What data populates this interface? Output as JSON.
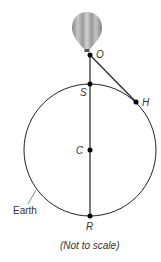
{
  "diagram": {
    "points": {
      "O": {
        "label": "O",
        "x": 90,
        "y": 55
      },
      "S": {
        "label": "S",
        "x": 90,
        "y": 84
      },
      "H": {
        "label": "H",
        "x": 136,
        "y": 102
      },
      "C": {
        "label": "C",
        "x": 90,
        "y": 150
      },
      "R": {
        "label": "R",
        "x": 90,
        "y": 216
      }
    },
    "circle": {
      "label": "Earth",
      "cx": 90,
      "cy": 150,
      "r": 66
    },
    "balloon": {
      "name": "hot-air-balloon"
    },
    "note": "(Not to scale)",
    "colors": {
      "stroke": "#222222",
      "text": "#333333"
    }
  }
}
